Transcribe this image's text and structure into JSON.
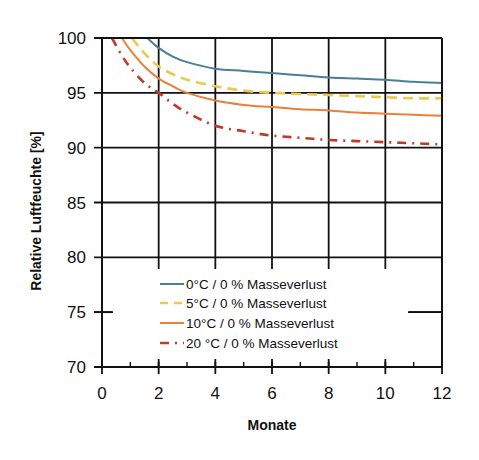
{
  "chart_data": {
    "type": "line",
    "title": "",
    "xlabel": "Monate",
    "ylabel": "Relative Luftfeuchte [%]",
    "xlim": [
      0,
      12
    ],
    "ylim": [
      70,
      100
    ],
    "x_ticks": [
      0,
      2,
      4,
      6,
      8,
      10,
      12
    ],
    "x_minor_ticks": [
      1,
      3,
      5,
      7,
      9,
      11
    ],
    "y_ticks": [
      70,
      75,
      80,
      85,
      90,
      95,
      100
    ],
    "grid": true,
    "legend_position": "lower center (inside plot)",
    "series": [
      {
        "name": "0°C / 0 % Masseverlust",
        "color": "#4a7f9a",
        "style": "solid",
        "x": [
          1.6,
          2,
          2.5,
          3,
          4,
          5,
          6,
          7,
          8,
          9,
          10,
          11,
          12
        ],
        "y": [
          100,
          99.1,
          98.3,
          97.8,
          97.2,
          97.0,
          96.8,
          96.6,
          96.4,
          96.3,
          96.2,
          96.0,
          95.9
        ]
      },
      {
        "name": "5°C / 0 % Masseverlust",
        "color": "#ecc94b",
        "style": "dashed",
        "x": [
          1.05,
          1.5,
          2,
          2.5,
          3,
          4,
          5,
          6,
          7,
          8,
          9,
          10,
          11,
          12
        ],
        "y": [
          100,
          98.6,
          97.4,
          96.7,
          96.2,
          95.6,
          95.2,
          95.0,
          94.9,
          94.8,
          94.7,
          94.6,
          94.5,
          94.5
        ]
      },
      {
        "name": "10°C / 0 % Masseverlust",
        "color": "#e8823a",
        "style": "solid",
        "x": [
          0.7,
          1,
          1.5,
          2,
          2.5,
          3,
          4,
          5,
          6,
          7,
          8,
          9,
          10,
          11,
          12
        ],
        "y": [
          100,
          98.9,
          97.4,
          96.3,
          95.6,
          95.0,
          94.3,
          93.9,
          93.7,
          93.5,
          93.4,
          93.2,
          93.1,
          93.0,
          92.9
        ]
      },
      {
        "name": "20 °C / 0 % Masseverlust",
        "color": "#c0392b",
        "style": "dashdot",
        "x": [
          0.35,
          0.7,
          1,
          1.5,
          2,
          2.5,
          3,
          4,
          5,
          6,
          7,
          8,
          9,
          10,
          11,
          12
        ],
        "y": [
          100,
          98.4,
          97.3,
          95.9,
          95.0,
          94.0,
          93.2,
          92.0,
          91.5,
          91.1,
          90.9,
          90.7,
          90.6,
          90.5,
          90.4,
          90.3
        ]
      }
    ]
  },
  "axes": {
    "x_title": "Monate",
    "y_title": "Relative Luftfeuchte [%]",
    "x_tick_labels": [
      "0",
      "2",
      "4",
      "6",
      "8",
      "10",
      "12"
    ],
    "y_tick_labels": [
      "100",
      "95",
      "90",
      "85",
      "80",
      "75",
      "70"
    ]
  },
  "legend": {
    "items": [
      {
        "label": "0°C / 0 % Masseverlust",
        "color": "#4a7f9a",
        "style": "solid"
      },
      {
        "label": "5°C / 0 % Masseverlust",
        "color": "#ecc94b",
        "style": "dashed"
      },
      {
        "label": "10°C / 0 % Masseverlust",
        "color": "#e8823a",
        "style": "solid"
      },
      {
        "label": "20 °C / 0 % Masseverlust",
        "color": "#c0392b",
        "style": "dashdot"
      }
    ]
  }
}
